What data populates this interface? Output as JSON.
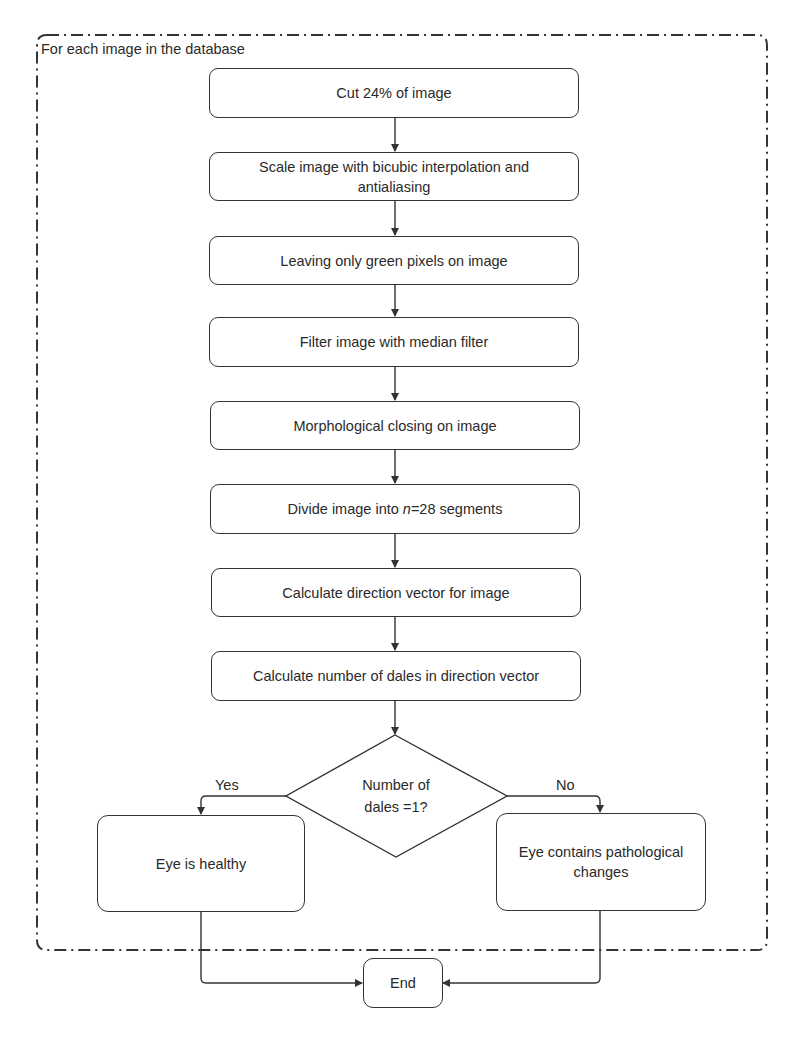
{
  "loop": {
    "label": "For each image in the database"
  },
  "steps": [
    {
      "id": "cut",
      "label": "Cut 24% of image"
    },
    {
      "id": "scale",
      "label": "Scale image with bicubic interpolation and antialiasing"
    },
    {
      "id": "green",
      "label": "Leaving only green pixels on image"
    },
    {
      "id": "median",
      "label": "Filter image with median filter"
    },
    {
      "id": "morph",
      "label": "Morphological closing on image"
    },
    {
      "id": "divide",
      "label_prefix": "Divide image into ",
      "label_var": "n",
      "label_suffix": "=28 segments"
    },
    {
      "id": "direction",
      "label": "Calculate direction vector for image"
    },
    {
      "id": "dales",
      "label": "Calculate number of dales in direction vector"
    }
  ],
  "decision": {
    "line1": "Number of",
    "line2": "dales =1?",
    "yes_label": "Yes",
    "no_label": "No"
  },
  "outcomes": {
    "healthy": "Eye is healthy",
    "pathological": "Eye contains pathological changes"
  },
  "end": {
    "label": "End"
  },
  "colors": {
    "stroke": "#333333",
    "text": "#2a2a2a",
    "background": "#ffffff"
  }
}
